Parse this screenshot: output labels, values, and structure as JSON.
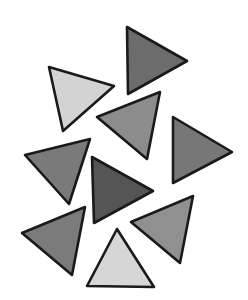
{
  "canvas": {
    "width": 248,
    "height": 300,
    "background": "#ffffff",
    "stroke_color": "#1a1a1a"
  },
  "triangles": [
    {
      "id": "tri-top-right",
      "points": "127,27 187,61 128,94",
      "fill": "#6c6c6c"
    },
    {
      "id": "tri-light-upper",
      "points": "49,67 114,86 63,131",
      "fill": "#d3d3d3"
    },
    {
      "id": "tri-center-upper",
      "points": "97,117 160,92 147,159",
      "fill": "#8c8c8c"
    },
    {
      "id": "tri-right",
      "points": "173,117 232,152 173,183",
      "fill": "#777777"
    },
    {
      "id": "tri-left-middle",
      "points": "25,155 90,139 69,204",
      "fill": "#7a7a7a"
    },
    {
      "id": "tri-dark-center",
      "points": "92,157 153,191 94,223",
      "fill": "#555555"
    },
    {
      "id": "tri-bottom-left",
      "points": "22,233 85,207 72,275",
      "fill": "#7b7b7b"
    },
    {
      "id": "tri-bottom-right",
      "points": "131,222 193,196 180,263",
      "fill": "#909090"
    },
    {
      "id": "tri-light-bottom",
      "points": "117,229 154,287 87,286",
      "fill": "#d6d6d6"
    }
  ]
}
